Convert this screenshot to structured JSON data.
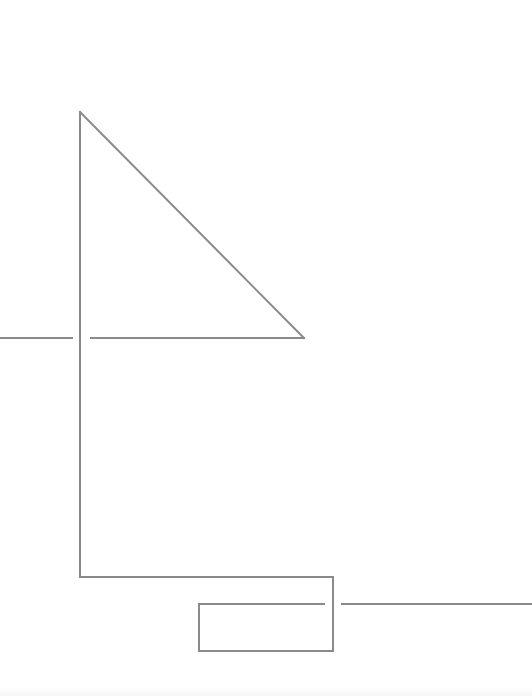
{
  "diagram": {
    "background": "#ffffff",
    "stroke_color": "#8a8a8a",
    "stroke_width": 2,
    "shapes": [
      {
        "name": "left-horizontal-segment",
        "type": "line",
        "points": [
          [
            0,
            338
          ],
          [
            72,
            338
          ]
        ]
      },
      {
        "name": "main-vertical-line",
        "type": "line",
        "points": [
          [
            80,
            112
          ],
          [
            80,
            577
          ]
        ]
      },
      {
        "name": "triangle-hypotenuse",
        "type": "line",
        "points": [
          [
            80,
            112
          ],
          [
            304,
            338
          ]
        ]
      },
      {
        "name": "triangle-base",
        "type": "line",
        "points": [
          [
            91,
            338
          ],
          [
            304,
            338
          ]
        ]
      },
      {
        "name": "bottom-bracket",
        "type": "polyline",
        "points": [
          [
            80,
            577
          ],
          [
            333,
            577
          ],
          [
            333,
            651
          ]
        ]
      },
      {
        "name": "inner-rectangle",
        "type": "polyline",
        "points": [
          [
            324,
            604
          ],
          [
            199,
            604
          ],
          [
            199,
            651
          ],
          [
            333,
            651
          ]
        ]
      },
      {
        "name": "right-horizontal-segment",
        "type": "line",
        "points": [
          [
            342,
            604
          ],
          [
            532,
            604
          ]
        ]
      }
    ]
  }
}
